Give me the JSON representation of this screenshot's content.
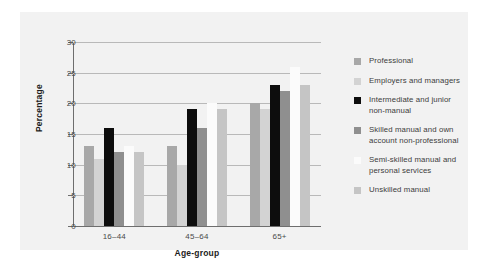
{
  "chart_data": {
    "type": "bar",
    "title": "",
    "xlabel": "Age-group",
    "ylabel": "Percentage",
    "categories": [
      "16–44",
      "45–64",
      "65+"
    ],
    "ylim": [
      0,
      30
    ],
    "yticks": [
      0,
      5,
      10,
      15,
      20,
      25,
      30
    ],
    "ytick_labels": [
      "0",
      "5",
      "10",
      "15",
      "20",
      "25",
      "30"
    ],
    "grid": true,
    "legend_position": "right",
    "series": [
      {
        "name": "Professional",
        "color": "#a8a8a8",
        "values": [
          13,
          13,
          20
        ]
      },
      {
        "name": "Employers and managers",
        "color": "#d3d3d3",
        "values": [
          11,
          10,
          19
        ]
      },
      {
        "name": "Intermediate and junior non-manual",
        "color": "#0d0d0d",
        "values": [
          16,
          19,
          23
        ]
      },
      {
        "name": "Skilled manual and own account non-professional",
        "color": "#8f8f8f",
        "values": [
          12,
          16,
          22
        ]
      },
      {
        "name": "Semi-skilled manual and personal services",
        "color": "#fbfbfb",
        "values": [
          13,
          20,
          26
        ]
      },
      {
        "name": "Unskilled manual",
        "color": "#c5c5c5",
        "values": [
          12,
          19,
          23
        ]
      }
    ]
  },
  "legend": {
    "items": [
      {
        "label": "Professional"
      },
      {
        "label": "Employers and managers"
      },
      {
        "label": "Intermediate and junior\nnon-manual"
      },
      {
        "label": "Skilled manual and own\naccount non-professional"
      },
      {
        "label": "Semi-skilled manual and\npersonal services"
      },
      {
        "label": "Unskilled manual"
      }
    ]
  }
}
